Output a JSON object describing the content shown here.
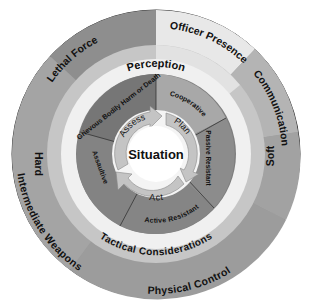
{
  "diagram": {
    "center_label": "Situation",
    "cycle": [
      "Assess",
      "Plan",
      "Act"
    ],
    "outer_ring": {
      "segments": [
        "Officer Presence",
        "Communication",
        "Physical Control",
        "Intermediate Weapons",
        "Lethal Force"
      ],
      "side_labels": {
        "right": "Soft",
        "left": "Hard"
      }
    },
    "middle_ring": {
      "top": "Perception",
      "bottom": "Tactical Considerations"
    },
    "inner_ring": {
      "segments": [
        "Cooperative",
        "Passive Resistant",
        "Active Resistant",
        "Assaultive",
        "Grievous Bodily Harm or Death"
      ]
    },
    "colors": {
      "outer_dark": "#8c8c8c",
      "outer_mid": "#a6a6a6",
      "officer_presence": "#e6e6e6",
      "communication": "#b3b3b3",
      "light_band": "#c8c8c8",
      "text_band": "#f0f0f0",
      "inner_dark": "#7a7a7a",
      "inner_light": "#a0a0a0",
      "arrow": "#c4c4c4",
      "center": "#ffffff"
    }
  }
}
